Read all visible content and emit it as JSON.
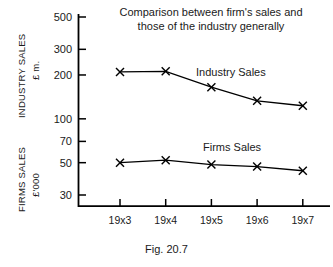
{
  "chart_data": {
    "type": "line",
    "title": "Comparison between firm's sales and those of the industry generally",
    "title_lines": [
      "Comparison between firm's sales and",
      "those of the industry generally"
    ],
    "caption": "Fig. 20.7",
    "xlabel": "",
    "categories": [
      "19x3",
      "19x4",
      "19x5",
      "19x6",
      "19x7"
    ],
    "yscale": "log",
    "ylim": [
      25,
      600
    ],
    "ytick_labels": [
      "500",
      "300",
      "200",
      "100",
      "70",
      "50",
      "30"
    ],
    "ytick_values": [
      500,
      300,
      200,
      100,
      70,
      50,
      30
    ],
    "grid": false,
    "legend_position": "inline-annotation",
    "axis_titles": {
      "industry_name": "INDUSTRY SALES",
      "industry_units": "£ m.",
      "firms_name": "FIRMS SALES",
      "firms_units": "£'000"
    },
    "series": [
      {
        "name": "Industry Sales",
        "units": "£ m.",
        "label": "Industry Sales",
        "marker": "x",
        "color": "#000000",
        "values": [
          210,
          212,
          165,
          133,
          123
        ]
      },
      {
        "name": "Firms Sales",
        "units": "£'000",
        "label": "Firms Sales",
        "marker": "x",
        "color": "#000000",
        "values": [
          50,
          52,
          48.5,
          47,
          44
        ]
      }
    ]
  },
  "colors": {
    "ink": "#1a1a1a",
    "axis": "#000000",
    "background": "#ffffff"
  }
}
